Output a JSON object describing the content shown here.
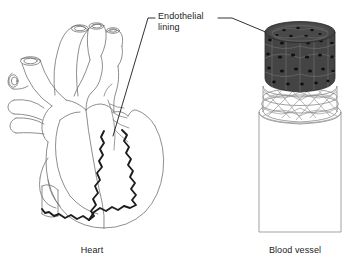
{
  "figure": {
    "type": "anatomical-diagram",
    "title_text": "",
    "background_color": "#ffffff",
    "line_color": "#6e6e6e",
    "bold_line_color": "#1a1a1a",
    "dark_fill_color": "#3a3a3a",
    "labels": {
      "endothelial_lining": "Endothelial\nlining"
    },
    "captions": {
      "heart": "Heart",
      "blood_vessel": "Blood vessel"
    },
    "panels": [
      {
        "name": "heart",
        "caption": "Heart",
        "description": "Anterior view line drawing of the human heart with great vessels; bold dark wavy line traces the endothelial lining of the chambers."
      },
      {
        "name": "blood-vessel",
        "caption": "Blood vessel",
        "description": "Cutaway cylinder of a blood vessel; dark speckled innermost layer is the endothelial lining, middle layer shows criss-crossing elastic and muscle fibres, outer tube is the vessel wall."
      }
    ],
    "leader_lines": [
      {
        "name": "leader-to-heart",
        "from": "Endothelial lining label",
        "to": "heart chamber lining"
      },
      {
        "name": "leader-to-vessel",
        "from": "Endothelial lining label",
        "to": "blood vessel inner lining"
      }
    ]
  }
}
